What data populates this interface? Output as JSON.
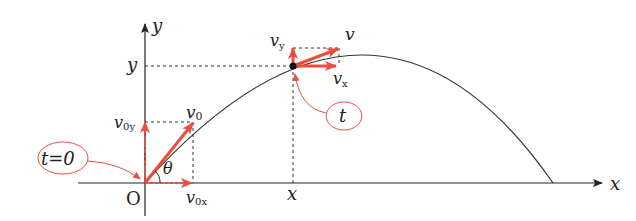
{
  "colors": {
    "axis": "#222222",
    "trajectory": "#333333",
    "vector": "#ef4b3a",
    "callout": "#e0524a",
    "dashed": "#333333"
  },
  "axes": {
    "x_label": "x",
    "y_label": "y",
    "origin_label": "O"
  },
  "initial": {
    "callout_label": "t=0",
    "v0_label": "v",
    "v0_sub": "0",
    "v0x_label": "v",
    "v0x_sub": "0x",
    "v0y_label": "v",
    "v0y_sub": "0y",
    "angle_label": "θ"
  },
  "moment": {
    "callout_label": "t",
    "v_label": "v",
    "vx_label": "v",
    "vx_sub": "x",
    "vy_label": "v",
    "vy_sub": "y",
    "x_tick_label": "x",
    "y_tick_label": "y"
  }
}
